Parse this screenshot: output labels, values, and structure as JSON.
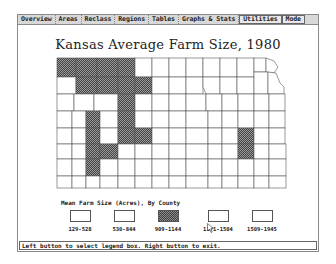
{
  "menubar": {
    "items": [
      {
        "label": "Overview"
      },
      {
        "label": "Areas"
      },
      {
        "label": "Reclass"
      },
      {
        "label": "Regions"
      },
      {
        "label": "Tables"
      },
      {
        "label": "Graphs & Stats"
      },
      {
        "label": "Utilities"
      },
      {
        "label": "Mode"
      }
    ]
  },
  "map": {
    "title": "Kansas Average Farm Size, 1980"
  },
  "legend": {
    "title": "Mean Farm Size (Acres), By County",
    "items": [
      {
        "label": "129-528",
        "pattern": "empty"
      },
      {
        "label": "530-844",
        "pattern": "empty"
      },
      {
        "label": "909-1144",
        "pattern": "hatched"
      },
      {
        "label": "1171-1504",
        "pattern": "empty"
      },
      {
        "label": "1509-1945",
        "pattern": "empty"
      }
    ]
  },
  "status": {
    "message": "Left button to select legend box. Right button to exit."
  },
  "colors": {
    "hatch_dark": "#444444",
    "hatch_light": "#888888",
    "menubar_bg": "#d8d8d8",
    "line": "#555555"
  }
}
